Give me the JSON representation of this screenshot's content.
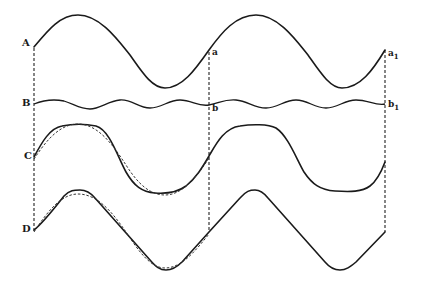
{
  "figure": {
    "rows": [
      {
        "id": "A",
        "label": "A",
        "period_end_label": "a",
        "end_label": "a1",
        "kind": "fundamental wave"
      },
      {
        "id": "B",
        "label": "B",
        "period_end_label": "b",
        "end_label": "b1",
        "kind": "harmonic wave (small amplitude, higher frequency)"
      },
      {
        "id": "C",
        "label": "C",
        "kind": "resultant wave (solid) over fundamental (dashed)"
      },
      {
        "id": "D",
        "label": "D",
        "kind": "resultant wave (solid) over fundamental (dashed)"
      }
    ],
    "labels": {
      "A": "A",
      "B": "B",
      "C": "C",
      "D": "D",
      "a": "a",
      "a1_main": "a",
      "a1_sub": "1",
      "b": "b",
      "b1_main": "b",
      "b1_sub": "1"
    },
    "colors": {
      "ink": "#1a1a1a",
      "background": "#ffffff"
    }
  }
}
